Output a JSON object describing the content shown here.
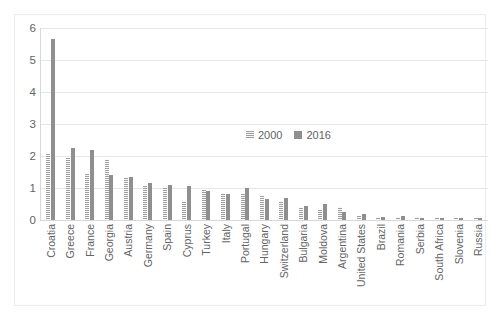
{
  "chart_data": {
    "type": "bar",
    "title": "",
    "xlabel": "",
    "ylabel": "",
    "ylim": [
      0,
      6
    ],
    "yticks": [
      0,
      1,
      2,
      3,
      4,
      5,
      6
    ],
    "grid": true,
    "legend_position": "inside-center-right",
    "categories": [
      "Croatia",
      "Greece",
      "France",
      "Georgia",
      "Austria",
      "Germany",
      "Spain",
      "Cyprus",
      "Turkey",
      "Italy",
      "Portugal",
      "Hungary",
      "Switzerland",
      "Bulgaria",
      "Moldova",
      "Argentina",
      "United States",
      "Brazil",
      "Romania",
      "Serbia",
      "South Africa",
      "Slovenia",
      "Russia"
    ],
    "series": [
      {
        "name": "2000",
        "color": "#9e9e9e",
        "pattern": "horizontal-hatch",
        "values": [
          2.05,
          1.95,
          1.45,
          1.9,
          1.3,
          1.05,
          1.0,
          0.6,
          0.95,
          0.85,
          0.8,
          0.75,
          0.6,
          0.4,
          0.3,
          0.4,
          0.12,
          0.1,
          0.08,
          0.1,
          0.06,
          0.07,
          0.05
        ]
      },
      {
        "name": "2016",
        "color": "#8f8f8f",
        "pattern": "solid",
        "values": [
          5.65,
          2.25,
          2.2,
          1.4,
          1.35,
          1.15,
          1.1,
          1.05,
          0.9,
          0.8,
          1.0,
          0.65,
          0.7,
          0.45,
          0.5,
          0.25,
          0.18,
          0.08,
          0.14,
          0.06,
          0.06,
          0.05,
          0.05
        ]
      }
    ]
  },
  "legend": {
    "entries": [
      {
        "label": "2000"
      },
      {
        "label": "2016"
      }
    ]
  },
  "axis": {
    "y_tick_labels": [
      "6",
      "5",
      "4",
      "3",
      "2",
      "1",
      "0"
    ]
  }
}
